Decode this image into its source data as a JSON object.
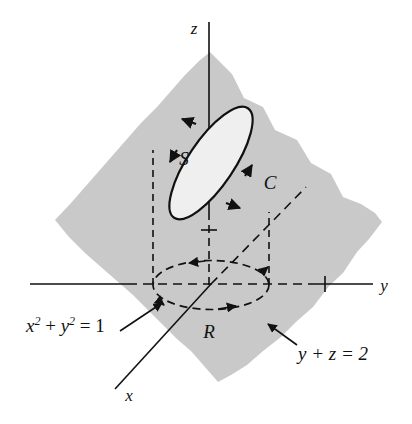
{
  "figure": {
    "background_color": "#ffffff",
    "plane_fill": "#c9c9c9",
    "surface_fill": "#efefef",
    "stroke_color": "#111111"
  },
  "axes": {
    "z": {
      "label": "z",
      "x": 196,
      "y": 33
    },
    "y": {
      "label": "y",
      "x": 382,
      "y": 290
    },
    "x": {
      "label": "x",
      "x": 128,
      "y": 400
    },
    "z_tick_value": "",
    "y_tick_value": ""
  },
  "labels": {
    "surface": {
      "text": "S",
      "x": 186,
      "y": 160
    },
    "curve": {
      "text": "C",
      "x": 268,
      "y": 190
    },
    "region": {
      "text": "R",
      "x": 206,
      "y": 337
    },
    "cylinder_equation": {
      "base": "x",
      "exp1": "2",
      "plus": " + ",
      "base2": "y",
      "exp2": "2",
      "equals": " = 1",
      "full": "x2 + y2 = 1",
      "x": 28,
      "y": 330
    },
    "plane_equation": {
      "text": "y + z = 2",
      "x": 292,
      "y": 353
    }
  },
  "geometry": {
    "origin": {
      "x": 211,
      "y": 284
    },
    "plane_vertices": "apex(210,52) right(382,222) bottom(218,382) left(55,220)",
    "base_ellipse": {
      "cx": 211,
      "cy": 285,
      "rx": 58,
      "ry": 25
    },
    "surface_ellipse": {
      "cx": 211,
      "cy": 163,
      "rx": 66,
      "ry": 23,
      "rotation_deg": 55
    },
    "cylinder_left_x": 153,
    "cylinder_right_x": 269,
    "y_axis_tick_x": 325,
    "z_axis_tick_y": 230
  }
}
